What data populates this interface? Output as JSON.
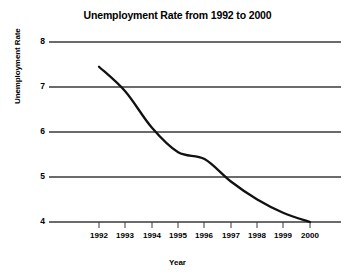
{
  "chart_data": {
    "type": "line",
    "title": "Unemployment Rate from 1992 to 2000",
    "xlabel": "Year",
    "ylabel": "Unemployment Rate",
    "x": [
      1992,
      1993,
      1994,
      1995,
      1996,
      1997,
      1998,
      1999,
      2000
    ],
    "categories": [
      "1992",
      "1993",
      "1994",
      "1995",
      "1996",
      "1997",
      "1998",
      "1999",
      "2000"
    ],
    "values": [
      7.45,
      6.9,
      6.1,
      5.55,
      5.4,
      4.9,
      4.5,
      4.2,
      4.0
    ],
    "series": [
      {
        "name": "Unemployment Rate",
        "values": [
          7.45,
          6.9,
          6.1,
          5.55,
          5.4,
          4.9,
          4.5,
          4.2,
          4.0
        ]
      }
    ],
    "ylim": [
      3.7,
      8.2
    ],
    "xlim": [
      1991.6,
      2000.5
    ],
    "yticks": [
      4,
      5,
      6,
      7,
      8
    ],
    "ytick_labels": [
      "4",
      "5",
      "6",
      "7",
      "8"
    ],
    "xticks": [
      1992,
      1993,
      1994,
      1995,
      1996,
      1997,
      1998,
      1999,
      2000
    ],
    "xtick_labels": [
      "1992",
      "1993",
      "1994",
      "1995",
      "1996",
      "1997",
      "1998",
      "1999",
      "2000"
    ],
    "grid": "horizontal",
    "legend": "none",
    "line_color": "#111111",
    "grid_color": "#3a3a3a",
    "background_color": "#ffffff"
  }
}
